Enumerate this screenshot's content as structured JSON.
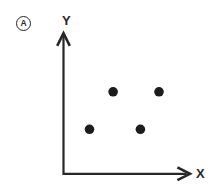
{
  "panel": {
    "label": "A"
  },
  "chart_data": {
    "type": "scatter",
    "title": "",
    "xlabel": "X",
    "ylabel": "Y",
    "axis_style": "schematic arrows, no ticks, no tick labels",
    "grid": false,
    "legend": null,
    "xlim": [
      0,
      1
    ],
    "ylim": [
      0,
      1
    ],
    "points_fraction_of_axis": [
      {
        "x": 0.4,
        "y": 0.59
      },
      {
        "x": 0.77,
        "y": 0.59
      },
      {
        "x": 0.21,
        "y": 0.32
      },
      {
        "x": 0.62,
        "y": 0.32
      }
    ],
    "point_color": "#1c1c1c",
    "axis_color": "#272727",
    "background": "#ffffff"
  }
}
